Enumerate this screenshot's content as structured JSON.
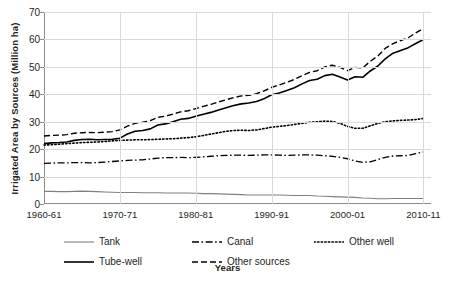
{
  "chart_data": {
    "type": "line",
    "title": "",
    "xlabel": "Years",
    "ylabel": "Irrigated Area by Sources (Million ha)",
    "ylim": [
      0,
      70
    ],
    "ytick_labels": [
      "0",
      "10",
      "20",
      "30",
      "40",
      "50",
      "60",
      "70"
    ],
    "ytick_values": [
      0,
      10,
      20,
      30,
      40,
      50,
      60,
      70
    ],
    "xtick_labels": [
      "1960-61",
      "1970-71",
      "1980-81",
      "1990-91",
      "2000-01",
      "2010-11"
    ],
    "xtick_values": [
      1960,
      1970,
      1980,
      1990,
      2000,
      2010
    ],
    "xlim": [
      1960,
      2011
    ],
    "grid": "horizontal-and-vertical",
    "legend_position": "bottom",
    "x": [
      1960,
      1961,
      1962,
      1963,
      1964,
      1965,
      1966,
      1967,
      1968,
      1969,
      1970,
      1971,
      1972,
      1973,
      1974,
      1975,
      1976,
      1977,
      1978,
      1979,
      1980,
      1981,
      1982,
      1983,
      1984,
      1985,
      1986,
      1987,
      1988,
      1989,
      1990,
      1991,
      1992,
      1993,
      1994,
      1995,
      1996,
      1997,
      1998,
      1999,
      2000,
      2001,
      2002,
      2003,
      2004,
      2005,
      2006,
      2007,
      2008,
      2009,
      2010
    ],
    "series": [
      {
        "name": "Tank",
        "style": "solid",
        "color": "#808080",
        "values": [
          4.6,
          4.6,
          4.5,
          4.5,
          4.6,
          4.7,
          4.6,
          4.5,
          4.4,
          4.3,
          4.2,
          4.2,
          4.2,
          4.1,
          4.1,
          4.1,
          4.0,
          4.0,
          4.0,
          4.0,
          3.9,
          3.8,
          3.8,
          3.7,
          3.6,
          3.5,
          3.4,
          3.3,
          3.3,
          3.3,
          3.3,
          3.3,
          3.2,
          3.1,
          3.1,
          3.1,
          2.9,
          2.8,
          2.7,
          2.6,
          2.5,
          2.4,
          2.2,
          2.1,
          1.9,
          1.9,
          2.0,
          2.0,
          2.0,
          2.0,
          2.0
        ]
      },
      {
        "name": "Tube-well",
        "style": "solid",
        "color": "#000000",
        "values": [
          22.0,
          22.3,
          22.4,
          22.6,
          23.2,
          23.5,
          23.6,
          23.4,
          23.5,
          23.6,
          24.0,
          25.5,
          26.5,
          26.8,
          27.4,
          28.8,
          29.2,
          30.0,
          30.9,
          31.2,
          32.0,
          32.7,
          33.4,
          34.3,
          35.1,
          35.9,
          36.5,
          36.8,
          37.4,
          38.4,
          39.8,
          40.5,
          41.4,
          42.4,
          43.8,
          45.0,
          45.5,
          46.8,
          47.3,
          46.3,
          45.2,
          46.4,
          46.2,
          48.5,
          50.3,
          53.0,
          55.0,
          56.0,
          57.0,
          58.5,
          60.0
        ]
      },
      {
        "name": "Canal",
        "style": "dash-dot",
        "color": "#000000",
        "values": [
          14.8,
          14.9,
          15.0,
          15.0,
          15.1,
          15.1,
          15.0,
          15.1,
          15.3,
          15.5,
          15.7,
          15.9,
          16.0,
          16.1,
          16.4,
          16.7,
          16.9,
          16.9,
          17.0,
          16.9,
          17.0,
          17.2,
          17.4,
          17.6,
          17.7,
          17.8,
          17.8,
          17.7,
          17.8,
          17.9,
          17.9,
          17.8,
          17.7,
          17.8,
          17.9,
          17.9,
          17.8,
          17.6,
          17.4,
          17.0,
          16.5,
          15.7,
          15.2,
          15.4,
          16.2,
          17.0,
          17.5,
          17.6,
          17.7,
          18.4,
          19.0
        ]
      },
      {
        "name": "Other well",
        "style": "dotted",
        "color": "#000000",
        "values": [
          21.5,
          21.6,
          21.8,
          22.0,
          22.2,
          22.4,
          22.5,
          22.6,
          22.8,
          23.0,
          23.2,
          23.3,
          23.4,
          23.4,
          23.5,
          23.6,
          23.7,
          23.8,
          24.0,
          24.2,
          24.5,
          25.0,
          25.5,
          26.0,
          26.5,
          26.8,
          26.9,
          26.8,
          27.0,
          27.5,
          28.0,
          28.3,
          28.6,
          29.0,
          29.4,
          29.8,
          30.0,
          30.2,
          30.1,
          29.4,
          28.3,
          27.6,
          27.6,
          28.5,
          29.4,
          30.0,
          30.3,
          30.5,
          30.6,
          30.8,
          31.2
        ]
      },
      {
        "name": "Other sources",
        "style": "dashed",
        "color": "#000000",
        "values": [
          24.8,
          25.0,
          25.1,
          25.3,
          25.8,
          26.0,
          26.1,
          26.0,
          26.2,
          26.4,
          27.0,
          28.4,
          29.4,
          29.8,
          30.4,
          31.6,
          32.0,
          32.8,
          33.6,
          34.0,
          34.8,
          35.6,
          36.3,
          37.2,
          38.0,
          38.8,
          39.4,
          39.6,
          40.2,
          41.2,
          42.5,
          43.4,
          44.4,
          45.4,
          46.8,
          48.0,
          48.6,
          50.0,
          50.6,
          49.8,
          48.6,
          49.8,
          49.6,
          52.0,
          54.0,
          56.8,
          58.5,
          59.6,
          60.6,
          62.4,
          64.0
        ]
      }
    ]
  },
  "legend": {
    "items": [
      {
        "label": "Tank",
        "style": "solid",
        "color": "#808080"
      },
      {
        "label": "Tube-well",
        "style": "solid",
        "color": "#000000"
      },
      {
        "label": "Canal",
        "style": "dash-dot",
        "color": "#000000"
      },
      {
        "label": "Other sources",
        "style": "dashed",
        "color": "#000000"
      },
      {
        "label": "Other well",
        "style": "dotted",
        "color": "#000000"
      }
    ]
  }
}
